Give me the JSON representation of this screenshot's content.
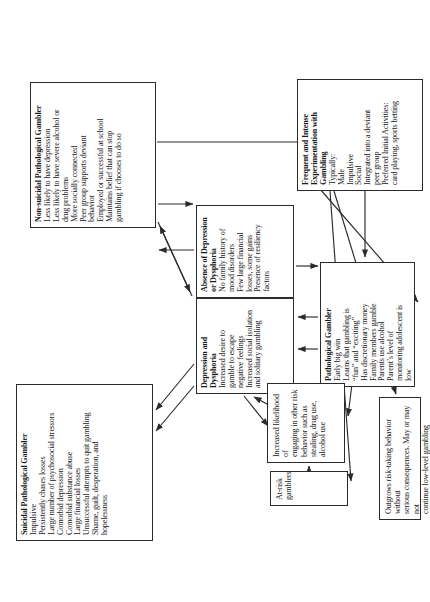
{
  "figure": {
    "orientation": "page rotated 90 degrees counter-clockwise",
    "nodes": {
      "suicidal": {
        "title": "Suicidal Pathological Gambler",
        "items": [
          "Impulsive",
          "Persistently chases losses",
          "Large number of psychosocial stressors",
          "Comorbid depression",
          "Comorbid substance abuse",
          "Large financial losses",
          "Unsuccessful attempts to quit gambling",
          "Shame, guilt, desperation, and\nhopelessness"
        ]
      },
      "nonsuicidal": {
        "title": "Non-suicidal Pathological Gambler",
        "items": [
          "Less likely to have depression",
          "Less likely to have severe alcohol or\ndrug problems",
          "More socially connected",
          "Peer group supports deviant\nbehavior",
          "Employed or successful at school",
          "Maintains belief that can stop\ngambling if chooses to do so"
        ]
      },
      "depression": {
        "title": "Depression and\nDysphoria",
        "items": [
          "Increased desire to\ngamble to escape\nnegative feelings",
          "Increased social isolation\nand solitary gambling"
        ]
      },
      "absence": {
        "title": "Absence of Depression\nor Dysphoria",
        "items": [
          "No family history of\nmood disorders",
          "Few large financial\nlosses, some gains",
          "Presence of resiliency\nfactors"
        ]
      },
      "pathological": {
        "title": "Pathological Gambler",
        "items": [
          "Early big win",
          "Learns that gambling is\n“fun” and “exciting”",
          "Has discretionary money",
          "Family members gamble",
          "Parents use alcohol",
          "Parent’s level of\nmonitoring adolescent is\nlow"
        ]
      },
      "increased": {
        "title": "",
        "body": "Increased likelihood of\nengaging in other risk\nbehavior such as\nstealing, drug use,\nalcohol use"
      },
      "atrisk": {
        "title": "",
        "body": "At-risk gamblers"
      },
      "outgrows": {
        "title": "",
        "body": "Outgrows risk-taking behavior without\nserious consequences. May or may not\ncontinue low-level gambling"
      },
      "experimentation": {
        "title": "Frequent and Intense\nExperimentation with\nGambling",
        "items": [
          "Typically:",
          "Male",
          "Impulsive",
          "Social",
          "Integrated into a deviant\npeer group",
          "Preferred Initial Activities:\ncard playing, sports betting"
        ]
      }
    },
    "colors": {
      "stroke": "#2b2b2b",
      "background": "#ffffff",
      "text": "#1a1a1a"
    }
  }
}
